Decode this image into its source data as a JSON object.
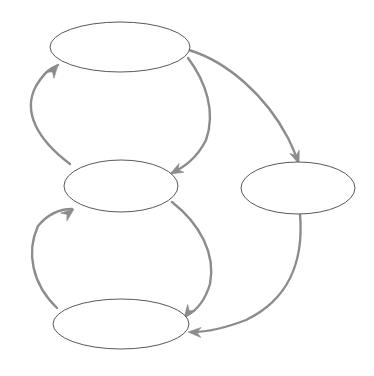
{
  "diagram": {
    "type": "directed-graph",
    "title": "",
    "background_color": "#ffffff",
    "canvas": {
      "width": 374,
      "height": 376
    },
    "node_style": {
      "shape": "ellipse",
      "fill": "#ffffff",
      "stroke_color": "#595959",
      "stroke_width": 1
    },
    "edge_style": {
      "stroke_color": "#8c8c8c",
      "stroke_width": 2.4,
      "arrowhead": "open-triangle",
      "curvature": "arc"
    },
    "nodes": [
      {
        "id": "node-top",
        "label": "",
        "cx": 120,
        "cy": 47,
        "rx": 70,
        "ry": 25
      },
      {
        "id": "node-middle",
        "label": "",
        "cx": 121,
        "cy": 186,
        "rx": 57,
        "ry": 26
      },
      {
        "id": "node-right",
        "label": "",
        "cx": 298,
        "cy": 188,
        "rx": 57,
        "ry": 26
      },
      {
        "id": "node-bottom",
        "label": "",
        "cx": 121,
        "cy": 324,
        "rx": 68,
        "ry": 25
      }
    ],
    "edges": [
      {
        "id": "edge-middle-to-top",
        "label": "",
        "from": "node-middle",
        "to": "node-top",
        "path": "M 70,164 C 38,140 22,112 36,86 C 44,73 50,68 58,65",
        "arrow_tip": {
          "x": 58,
          "y": 65
        },
        "arrow_angle": -52
      },
      {
        "id": "edge-top-to-middle",
        "label": "",
        "from": "node-top",
        "to": "node-middle",
        "path": "M 188,58 C 206,82 216,112 206,140 C 196,160 182,168 172,173",
        "arrow_tip": {
          "x": 170,
          "y": 174
        },
        "arrow_angle": 152
      },
      {
        "id": "edge-bottom-to-middle",
        "label": "",
        "from": "node-bottom",
        "to": "node-middle",
        "path": "M 57,308 C 32,284 26,252 38,226 C 48,214 60,209 72,209",
        "arrow_tip": {
          "x": 74,
          "y": 209
        },
        "arrow_angle": -38
      },
      {
        "id": "edge-middle-to-bottom",
        "label": "",
        "from": "node-middle",
        "to": "node-bottom",
        "path": "M 172,202 C 200,224 216,254 210,284 C 204,304 194,312 186,316",
        "arrow_tip": {
          "x": 184,
          "y": 318
        },
        "arrow_angle": 126
      },
      {
        "id": "edge-top-to-right",
        "label": "",
        "from": "node-top",
        "to": "node-right",
        "path": "M 189,50 C 228,62 266,96 288,138 C 293,148 296,156 298,161",
        "arrow_tip": {
          "x": 299,
          "y": 164
        },
        "arrow_angle": 70
      },
      {
        "id": "edge-right-to-bottom",
        "label": "",
        "from": "node-right",
        "to": "node-bottom",
        "path": "M 300,214 C 304,262 288,300 246,320 C 220,330 202,332 192,332",
        "arrow_tip": {
          "x": 188,
          "y": 332
        },
        "arrow_angle": 182
      }
    ]
  }
}
